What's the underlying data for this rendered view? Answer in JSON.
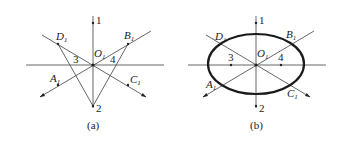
{
  "figure_a": {
    "caption": "(a)",
    "center_label": "O",
    "center_sub": "1",
    "points": [
      {
        "name": "A",
        "sub": "1"
      },
      {
        "name": "B",
        "sub": "1"
      },
      {
        "name": "C",
        "sub": "1"
      },
      {
        "name": "D",
        "sub": "1"
      }
    ],
    "numbers": [
      "1",
      "2",
      "3",
      "4"
    ]
  },
  "figure_b": {
    "caption": "(b)",
    "center_label": "O",
    "center_sub": "1",
    "points": [
      {
        "name": "A",
        "sub": "1"
      },
      {
        "name": "B",
        "sub": "1"
      },
      {
        "name": "C",
        "sub": "1"
      },
      {
        "name": "D",
        "sub": "1"
      }
    ],
    "numbers": [
      "1",
      "2",
      "3",
      "4"
    ]
  },
  "colors": {
    "line": "#555555",
    "ellipse": "#1a1a1a",
    "background": "#ffffff"
  }
}
